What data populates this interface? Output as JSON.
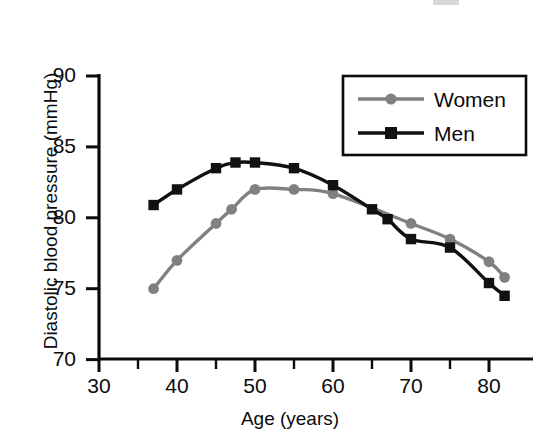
{
  "chart_data": {
    "type": "line",
    "title": "",
    "xlabel": "Age (years)",
    "ylabel": "Diastolic blood pressure (mmHg)",
    "xlim": [
      30,
      83
    ],
    "ylim": [
      70,
      90
    ],
    "xticks": [
      30,
      40,
      50,
      60,
      70,
      80
    ],
    "xtick_labels": [
      "30",
      "40",
      "50",
      "60",
      "70",
      "80"
    ],
    "xminorticks": [
      35,
      45,
      55,
      65,
      75
    ],
    "yticks": [
      70,
      75,
      80,
      85,
      90
    ],
    "ytick_labels": [
      "70",
      "75",
      "80",
      "85",
      "90"
    ],
    "grid": false,
    "legend_position": "upper right",
    "series": [
      {
        "name": "Women",
        "marker": "circle",
        "color": "#808080",
        "x": [
          37,
          40,
          45,
          47,
          50,
          55,
          60,
          70,
          75,
          80,
          82
        ],
        "y": [
          75.0,
          77.0,
          79.6,
          80.6,
          82.0,
          82.0,
          81.7,
          79.6,
          78.5,
          76.9,
          75.8
        ]
      },
      {
        "name": "Men",
        "marker": "square",
        "color": "#111111",
        "x": [
          37,
          40,
          45,
          47.5,
          50,
          55,
          60,
          65,
          67,
          70,
          75,
          80,
          82
        ],
        "y": [
          80.9,
          82.0,
          83.5,
          83.9,
          83.9,
          83.5,
          82.3,
          80.6,
          79.9,
          78.5,
          77.9,
          75.4,
          74.5
        ]
      }
    ]
  },
  "legend": {
    "items": [
      {
        "label": "Women",
        "color": "#808080",
        "marker": "circle"
      },
      {
        "label": "Men",
        "color": "#111111",
        "marker": "square"
      }
    ]
  },
  "colors": {
    "women": "#808080",
    "men": "#111111",
    "axis": "#0b0b0b",
    "background": "#ffffff"
  }
}
